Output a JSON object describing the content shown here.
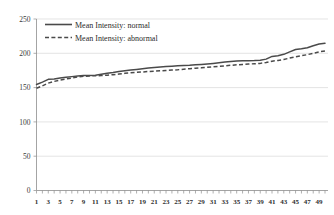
{
  "chart_data": {
    "type": "line",
    "title": "",
    "subtitle": "",
    "xlabel": "",
    "ylabel": "",
    "xlim": [
      1,
      50
    ],
    "ylim": [
      0,
      250
    ],
    "grid": true,
    "legend_position": "top-left",
    "yticks": [
      0,
      50,
      100,
      150,
      200,
      250
    ],
    "ytick_labels": [
      "0",
      "50",
      "100",
      "150",
      "200",
      "250"
    ],
    "x": [
      1,
      2,
      3,
      4,
      5,
      6,
      7,
      8,
      9,
      10,
      11,
      12,
      13,
      14,
      15,
      16,
      17,
      18,
      19,
      20,
      21,
      22,
      23,
      24,
      25,
      26,
      27,
      28,
      29,
      30,
      31,
      32,
      33,
      34,
      35,
      36,
      37,
      38,
      39,
      40,
      41,
      42,
      43,
      44,
      45,
      46,
      47,
      48,
      49,
      50
    ],
    "xtick_labels": [
      "1",
      "3",
      "5",
      "7",
      "9",
      "11",
      "13",
      "15",
      "17",
      "19",
      "21",
      "23",
      "25",
      "27",
      "29",
      "31",
      "33",
      "35",
      "37",
      "39",
      "41",
      "43",
      "45",
      "47",
      "49"
    ],
    "series": [
      {
        "name": "Mean Intensity: normal",
        "style": "solid",
        "color": "#4a4a4a",
        "values": [
          154.5,
          158.0,
          162.0,
          162.5,
          164.0,
          165.0,
          166.0,
          167.0,
          167.5,
          167.8,
          168.0,
          169.5,
          171.0,
          172.0,
          173.5,
          174.5,
          175.5,
          176.5,
          177.5,
          178.5,
          179.3,
          180.0,
          180.6,
          181.2,
          181.8,
          182.2,
          182.6,
          183.2,
          183.8,
          184.5,
          185.3,
          186.3,
          187.3,
          188.2,
          188.7,
          189.0,
          189.2,
          189.5,
          190.0,
          191.5,
          195.5,
          196.5,
          198.5,
          202.0,
          205.5,
          206.5,
          208.0,
          211.0,
          213.5,
          214.5
        ]
      },
      {
        "name": "Mean Intensity: abnormal",
        "style": "dashed",
        "color": "#4a4a4a",
        "values": [
          149.0,
          152.5,
          156.5,
          159.0,
          161.0,
          162.5,
          164.0,
          165.5,
          166.5,
          167.0,
          167.2,
          167.5,
          168.0,
          168.8,
          169.8,
          170.8,
          171.5,
          172.2,
          172.8,
          173.5,
          174.0,
          174.5,
          175.0,
          175.5,
          176.0,
          176.8,
          177.5,
          178.2,
          178.8,
          179.5,
          180.2,
          181.0,
          181.8,
          182.5,
          183.2,
          183.8,
          184.3,
          184.8,
          185.3,
          186.5,
          188.5,
          189.5,
          191.0,
          193.0,
          195.0,
          196.5,
          198.0,
          200.0,
          202.0,
          203.5
        ]
      }
    ]
  },
  "legend": {
    "entries": [
      {
        "label": "Mean Intensity: normal",
        "style": "solid"
      },
      {
        "label": "Mean Intensity: abnormal",
        "style": "dashed"
      }
    ]
  }
}
